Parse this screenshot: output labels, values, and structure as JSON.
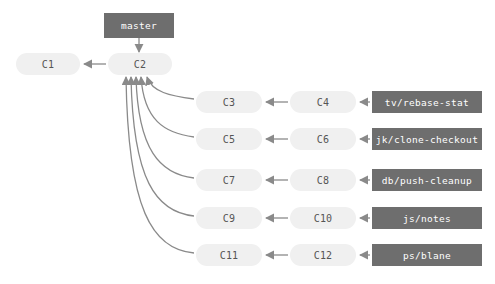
{
  "diagram": {
    "colors": {
      "background": "#ffffff",
      "commit_fill": "#f0f0f0",
      "commit_text": "#555555",
      "label_fill": "#6e6e6e",
      "label_text": "#ffffff",
      "arrow": "#8a8a8a"
    }
  },
  "head_label": {
    "name": "master",
    "text": "master"
  },
  "commits": [
    {
      "id": "C1",
      "text": "C1",
      "x": 16,
      "y": 53,
      "w": 64,
      "h": 22
    },
    {
      "id": "C2",
      "text": "C2",
      "x": 108,
      "y": 53,
      "w": 64,
      "h": 22
    },
    {
      "id": "C3",
      "text": "C3",
      "x": 196,
      "y": 91,
      "w": 66,
      "h": 22
    },
    {
      "id": "C4",
      "text": "C4",
      "x": 290,
      "y": 91,
      "w": 66,
      "h": 22
    },
    {
      "id": "C5",
      "text": "C5",
      "x": 196,
      "y": 128,
      "w": 66,
      "h": 22
    },
    {
      "id": "C6",
      "text": "C6",
      "x": 290,
      "y": 128,
      "w": 66,
      "h": 22
    },
    {
      "id": "C7",
      "text": "C7",
      "x": 196,
      "y": 169,
      "w": 66,
      "h": 22
    },
    {
      "id": "C8",
      "text": "C8",
      "x": 290,
      "y": 169,
      "w": 66,
      "h": 22
    },
    {
      "id": "C9",
      "text": "C9",
      "x": 196,
      "y": 207,
      "w": 66,
      "h": 22
    },
    {
      "id": "C10",
      "text": "C10",
      "x": 290,
      "y": 207,
      "w": 66,
      "h": 22
    },
    {
      "id": "C11",
      "text": "C11",
      "x": 196,
      "y": 244,
      "w": 66,
      "h": 22
    },
    {
      "id": "C12",
      "text": "C12",
      "x": 290,
      "y": 244,
      "w": 66,
      "h": 22
    }
  ],
  "branch_labels": [
    {
      "name": "tv/rebase-stat",
      "text": "tv/rebase-stat",
      "x": 372,
      "y": 91,
      "w": 110,
      "h": 22
    },
    {
      "name": "jk/clone-checkout",
      "text": "jk/clone-checkout",
      "x": 372,
      "y": 128,
      "w": 110,
      "h": 22
    },
    {
      "name": "db/push-cleanup",
      "text": "db/push-cleanup",
      "x": 372,
      "y": 169,
      "w": 110,
      "h": 22
    },
    {
      "name": "js/notes",
      "text": "js/notes",
      "x": 372,
      "y": 207,
      "w": 110,
      "h": 22
    },
    {
      "name": "ps/blane",
      "text": "ps/blane",
      "x": 372,
      "y": 244,
      "w": 110,
      "h": 22
    }
  ]
}
